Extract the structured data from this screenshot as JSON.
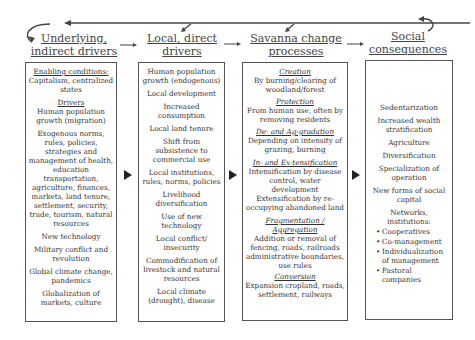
{
  "headers": [
    {
      "line1": "Underlying,",
      "line2": "indirect drivers"
    },
    {
      "line1": "Local, direct",
      "line2": "drivers"
    },
    {
      "line1": "Savanna change",
      "line2": "processes"
    },
    {
      "line1": "Social",
      "line2": "consequences"
    }
  ],
  "box1": {
    "enabling_title": "Enabling conditions:",
    "enabling_text": "Capitalism, centralized states",
    "drivers_title": "Drivers",
    "items": [
      "Human population growth (migration)",
      "Exogenous norms, rules, policies, strategies and management of health, education transportation, agriculture, finances, markets, land tenure, settlement, security, trade, tourism, natural resources",
      "New technology",
      "Military conflict and revolution",
      "Global climate change, pandemics",
      "Globalization of markets, culture"
    ]
  },
  "box2": {
    "items": [
      "Human population growth (endogenous)",
      "Local development",
      "Increased consumption",
      "Local land tenure",
      "Shift from subsistence to commercial use",
      "Local institutions, rules, norms, policies",
      "Livelihood diversification",
      "Use of new technology",
      "Local conflict/ insecurity",
      "Commodification of livestock and natural resources",
      "Local climate (drought), disease"
    ]
  },
  "box3": {
    "sections": [
      {
        "title": "Creation",
        "text": "By burning/clearing of woodland/forest"
      },
      {
        "title": "Protection",
        "text": "From human use, often by removing residents"
      },
      {
        "title": "De- and Ag-gradation",
        "text": "Depending on intensity of grazing, burning"
      },
      {
        "title": "In- and Ex-tensification",
        "text": "Intensification by disease control, water development Extensification by re-occupying abandoned land"
      },
      {
        "title": "Fragmentation / Aggregation",
        "text": "Addition or removal of fencing, roads, railroads administrative boundaries, use rules"
      },
      {
        "title": "Conversion",
        "text": "Expansion cropland, roads, settlement, railways"
      }
    ]
  },
  "box4": {
    "items": [
      "Sedentarization",
      "Increased wealth stratification",
      "Agriculture",
      "Diversification",
      "Specialization of operation",
      "New forms of social capital"
    ],
    "networks_title": "Networks, institutions:",
    "networks": [
      "Cooperatives",
      "Co-management",
      "Individualization of management",
      "Pastoral companies"
    ]
  },
  "colors": {
    "line": "#444444",
    "arrow": "#222222",
    "border": "#555555"
  }
}
